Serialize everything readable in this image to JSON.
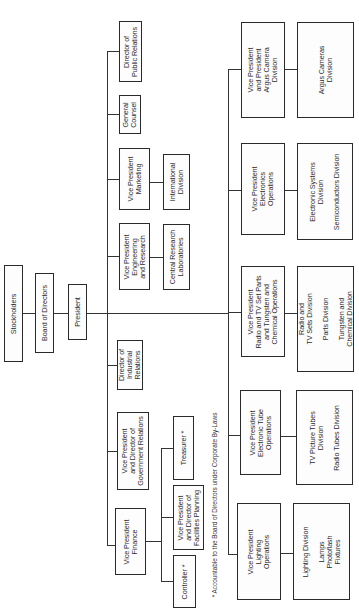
{
  "diagram": {
    "type": "org-chart",
    "orientation": "rotated-90-ccw",
    "line_color": "#333333",
    "border_color": "#2a2a2a"
  },
  "nodes": [
    {
      "id": "stockholders",
      "label": "Stockholders",
      "x": 4,
      "y": 265,
      "w": 19,
      "h": 97
    },
    {
      "id": "board",
      "label": "Board of Directors",
      "x": 35,
      "y": 273,
      "w": 19,
      "h": 80
    },
    {
      "id": "president",
      "label": "President",
      "x": 68,
      "y": 284,
      "w": 19,
      "h": 56
    },
    {
      "id": "dir-public-relations",
      "label": "Director of\nPublic Relations",
      "x": 119,
      "y": 21,
      "w": 23,
      "h": 61
    },
    {
      "id": "general-counsel",
      "label": "General\nCounsel",
      "x": 119,
      "y": 95,
      "w": 22,
      "h": 39
    },
    {
      "id": "vp-marketing",
      "label": "Vice President\nMarketing",
      "x": 119,
      "y": 148,
      "w": 31,
      "h": 62
    },
    {
      "id": "international-division",
      "label": "International\nDivision",
      "x": 163,
      "y": 154,
      "w": 27,
      "h": 56
    },
    {
      "id": "vp-engineering-research",
      "label": "Vice President\nEngineering\nand Research",
      "x": 119,
      "y": 223,
      "w": 31,
      "h": 67
    },
    {
      "id": "central-research-labs",
      "label": "Central Research\nLaboratories",
      "x": 163,
      "y": 224,
      "w": 27,
      "h": 66
    },
    {
      "id": "dir-industrial-relations",
      "label": "Director of\nIndustrial\nRelations",
      "x": 117,
      "y": 340,
      "w": 26,
      "h": 50
    },
    {
      "id": "vp-government-relations",
      "label": "Vice President\nand Director of\nGovernment Relations",
      "x": 117,
      "y": 412,
      "w": 32,
      "h": 78
    },
    {
      "id": "vp-finance",
      "label": "Vice President\nFinance",
      "x": 115,
      "y": 508,
      "w": 31,
      "h": 67
    },
    {
      "id": "treasurer",
      "label": "Treasurer *",
      "x": 173,
      "y": 416,
      "w": 21,
      "h": 64
    },
    {
      "id": "vp-facilities-planning",
      "label": "Vice President\nand Director of\nFacilities Planning",
      "x": 173,
      "y": 485,
      "w": 31,
      "h": 65
    },
    {
      "id": "controller",
      "label": "Controller *",
      "x": 173,
      "y": 555,
      "w": 23,
      "h": 53
    },
    {
      "id": "vp-argus-camera",
      "label": "Vice President\nand President\nArgus Camera\nDivision",
      "x": 241,
      "y": 22,
      "w": 44,
      "h": 96
    },
    {
      "id": "argus-cameras-division",
      "label": "Argus Cameras\nDivision",
      "x": 297,
      "y": 22,
      "w": 57,
      "h": 96
    },
    {
      "id": "vp-electronics-operations",
      "label": "Vice President\nElectronics\nOperations",
      "x": 241,
      "y": 143,
      "w": 44,
      "h": 92
    },
    {
      "id": "electronic-systems-division",
      "label": "Electronic Systems\nDivision\n\nSemiconductors Division",
      "x": 297,
      "y": 143,
      "w": 56,
      "h": 97
    },
    {
      "id": "vp-radio-tv-tungsten",
      "label": "Vice President\nRadio and TV Set Parts\nand Tungsten and\nChemical Operations",
      "x": 241,
      "y": 266,
      "w": 44,
      "h": 91
    },
    {
      "id": "radio-tv-sets-division",
      "label": "Radio and\nTV Sets Division\n\nParts Division\n\nTungsten and\nChemical Division",
      "x": 297,
      "y": 266,
      "w": 57,
      "h": 106
    },
    {
      "id": "vp-electronic-tube-operations",
      "label": "Vice President\nElectronic Tube\nOperations",
      "x": 240,
      "y": 390,
      "w": 41,
      "h": 85
    },
    {
      "id": "tv-picture-tubes-division",
      "label": "TV Picture Tubes\nDivision\n\nRadio Tubes Division",
      "x": 296,
      "y": 390,
      "w": 57,
      "h": 95
    },
    {
      "id": "vp-lighting-operations",
      "label": "Vice President\nLighting\nOperations",
      "x": 237,
      "y": 503,
      "w": 44,
      "h": 97
    },
    {
      "id": "lighting-division",
      "label": "Lighting Division\n\nLamps\nPhotoflash\nFixtures",
      "x": 293,
      "y": 503,
      "w": 57,
      "h": 97
    }
  ],
  "lines": [
    {
      "x": 22,
      "y": 313,
      "w": 14,
      "h": 1
    },
    {
      "x": 54,
      "y": 313,
      "w": 14,
      "h": 1
    },
    {
      "x": 87,
      "y": 313,
      "w": 142,
      "h": 1
    },
    {
      "x": 107,
      "y": 51,
      "w": 1,
      "h": 495
    },
    {
      "x": 107,
      "y": 51,
      "w": 12,
      "h": 1
    },
    {
      "x": 107,
      "y": 114,
      "w": 12,
      "h": 1
    },
    {
      "x": 107,
      "y": 179,
      "w": 12,
      "h": 1
    },
    {
      "x": 150,
      "y": 182,
      "w": 13,
      "h": 1
    },
    {
      "x": 107,
      "y": 256,
      "w": 12,
      "h": 1
    },
    {
      "x": 150,
      "y": 257,
      "w": 13,
      "h": 1
    },
    {
      "x": 107,
      "y": 365,
      "w": 10,
      "h": 1
    },
    {
      "x": 107,
      "y": 451,
      "w": 10,
      "h": 1
    },
    {
      "x": 107,
      "y": 545,
      "w": 8,
      "h": 1
    },
    {
      "x": 146,
      "y": 541,
      "w": 16,
      "h": 1
    },
    {
      "x": 161,
      "y": 448,
      "w": 1,
      "h": 134
    },
    {
      "x": 161,
      "y": 448,
      "w": 12,
      "h": 1
    },
    {
      "x": 161,
      "y": 517,
      "w": 12,
      "h": 1
    },
    {
      "x": 161,
      "y": 581,
      "w": 12,
      "h": 1
    },
    {
      "x": 228,
      "y": 69,
      "w": 1,
      "h": 486
    },
    {
      "x": 228,
      "y": 69,
      "w": 13,
      "h": 1
    },
    {
      "x": 285,
      "y": 69,
      "w": 12,
      "h": 1
    },
    {
      "x": 228,
      "y": 190,
      "w": 13,
      "h": 1
    },
    {
      "x": 285,
      "y": 190,
      "w": 12,
      "h": 1
    },
    {
      "x": 228,
      "y": 312,
      "w": 13,
      "h": 1
    },
    {
      "x": 285,
      "y": 313,
      "w": 12,
      "h": 1
    },
    {
      "x": 228,
      "y": 435,
      "w": 12,
      "h": 1
    },
    {
      "x": 281,
      "y": 436,
      "w": 15,
      "h": 1
    },
    {
      "x": 228,
      "y": 554,
      "w": 9,
      "h": 1
    },
    {
      "x": 281,
      "y": 553,
      "w": 12,
      "h": 1
    }
  ],
  "footnote": "* Accountable to the Board of Directors under Corporate By-Laws"
}
